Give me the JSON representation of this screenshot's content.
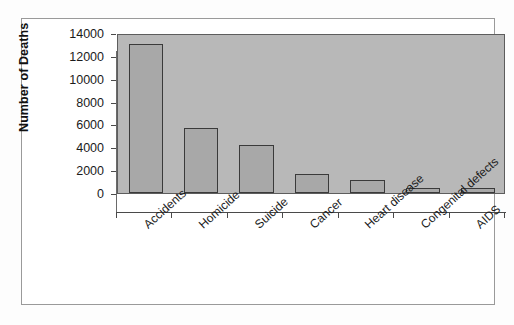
{
  "chart_data": {
    "type": "bar",
    "title": "",
    "subtitle": "",
    "xlabel": "",
    "ylabel": "Number of Deaths",
    "categories": [
      "Accidents",
      "Homicide",
      "Suicide",
      "Cancer",
      "Heart disease",
      "Congenital defects",
      "AIDS"
    ],
    "values": [
      13000,
      5700,
      4200,
      1700,
      1100,
      450,
      400
    ],
    "ylim": [
      0,
      14000
    ],
    "ytick_values": [
      14000,
      12000,
      10000,
      8000,
      6000,
      4000,
      2000,
      0
    ],
    "ytick_labels": [
      "14000",
      "12000",
      "10000",
      "8000",
      "6000",
      "4000",
      "2000",
      "0"
    ],
    "grid": false,
    "legend": false,
    "legend_position": "none",
    "bar_fill_color": "#a8a8a8",
    "bar_border_color": "#3a3a3a",
    "plot_background_color": "#b8b8b8",
    "figure_background_color": "#ffffff",
    "frame_border_color": "#9a9a9a",
    "axis_color": "#4a4a4a",
    "text_color": "#1b1b1b",
    "xlabel_rotation_degrees": -42
  },
  "axes": {
    "y_title": "Number of Deaths"
  }
}
